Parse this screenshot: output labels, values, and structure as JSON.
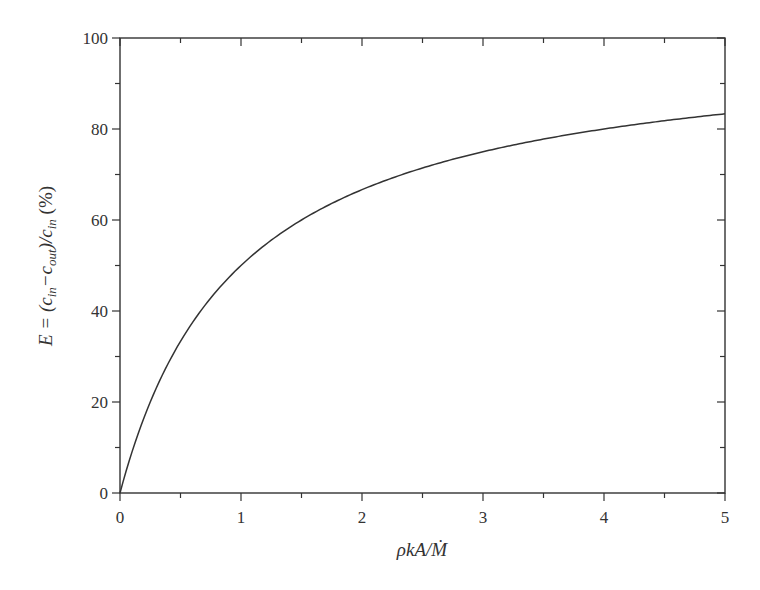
{
  "chart_data": {
    "type": "line",
    "title": "",
    "xlabel": "ρkA/Ṁ",
    "ylabel": "E = (c_in − c_out)/c_in (%)",
    "xlim": [
      0,
      5
    ],
    "ylim": [
      0,
      100
    ],
    "x_ticks": [
      "0",
      "1",
      "2",
      "3",
      "4",
      "5"
    ],
    "y_ticks": [
      "0",
      "20",
      "40",
      "60",
      "80",
      "100"
    ],
    "grid": false,
    "legend": null,
    "series": [
      {
        "name": "E",
        "formula": "E = 100 * x / (1 + x)",
        "x": [
          0,
          0.25,
          0.5,
          0.75,
          1,
          1.5,
          2,
          2.5,
          3,
          3.5,
          4,
          4.5,
          5
        ],
        "y": [
          0,
          20,
          33.3,
          42.9,
          50,
          60,
          66.7,
          71.4,
          75,
          77.8,
          80,
          81.8,
          83.3
        ]
      }
    ]
  },
  "labels": {
    "x_axis": "ρkA/Ṁ",
    "y_axis_prefix": "E = (c",
    "y_in": "in",
    "y_mid": "−c",
    "y_out": "out",
    "y_close": ")/c",
    "y_in2": "in",
    "y_unit": " (%)"
  }
}
